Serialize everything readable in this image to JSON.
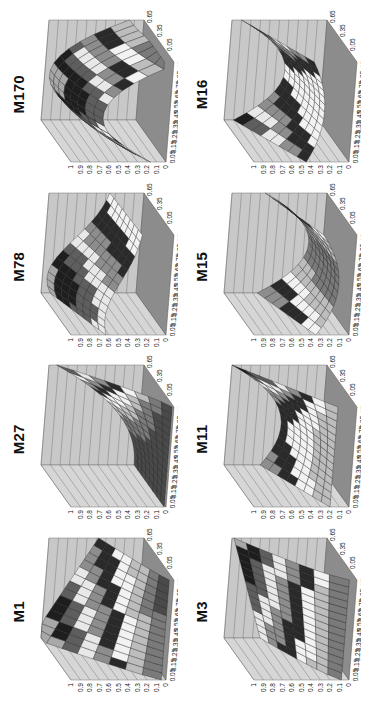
{
  "figure": {
    "orientation": "rotated-90-ccw",
    "panels": [
      {
        "id": "M1",
        "title": "M1",
        "shape": "ridge-rising-to-back-left"
      },
      {
        "id": "M27",
        "title": "M27",
        "shape": "corner-peak-back-right"
      },
      {
        "id": "M78",
        "title": "M78",
        "shape": "peak-left-falling-right"
      },
      {
        "id": "M170",
        "title": "M170",
        "shape": "dome-plateau"
      },
      {
        "id": "M3",
        "title": "M3",
        "shape": "rising-slope-back"
      },
      {
        "id": "M11",
        "title": "M11",
        "shape": "saddle-high-right-corner"
      },
      {
        "id": "M15",
        "title": "M15",
        "shape": "valley-u-shape"
      },
      {
        "id": "M16",
        "title": "M16",
        "shape": "saddle-two-peaks"
      }
    ]
  },
  "chart_data": {
    "type": "surface",
    "layout": {
      "rows": 2,
      "cols": 4,
      "rotation_deg": -90
    },
    "x_ticks": [
      "0.05",
      "0.15",
      "0.25",
      "0.35",
      "0.45",
      "0.55",
      "0.65",
      "0.75",
      "0.85",
      "0.95"
    ],
    "y_ticks": [
      "0.05",
      "0.35",
      "0.65"
    ],
    "z_ticks": [
      "0",
      "0.1",
      "0.2",
      "0.3",
      "0.4",
      "0.5",
      "0.6",
      "0.7",
      "0.8",
      "0.9",
      "1"
    ],
    "zlim": [
      0,
      1
    ],
    "grid": true,
    "legend": null,
    "colormap": "grayscale-banded (0.1 intervals, alternating dark/light bands)",
    "panels": [
      {
        "title": "M1",
        "description": "Surface rises from near 0 at front to ~1 along back-left edge"
      },
      {
        "title": "M27",
        "description": "Low flat surface near 0 except a corner rising to ~0.9 at back-right"
      },
      {
        "title": "M78",
        "description": "Peak ~0.95 at low x, descending to ~0.3 at high x"
      },
      {
        "title": "M170",
        "description": "Dome/plateau reaching ~0.95 across middle x values, dropping at edges"
      },
      {
        "title": "M3",
        "description": "Surface rising steadily to ~0.95 toward back"
      },
      {
        "title": "M11",
        "description": "Saddle; ~0.5 at low x, min ~0.2 middle, rising to ~1 at high-x corner"
      },
      {
        "title": "M15",
        "description": "U-shaped valley; ~0.65 at both x ends, min ~0.15 in middle"
      },
      {
        "title": "M16",
        "description": "Saddle; two peaks ~0.8 at ends, dipping to ~0.3 in middle"
      }
    ]
  }
}
